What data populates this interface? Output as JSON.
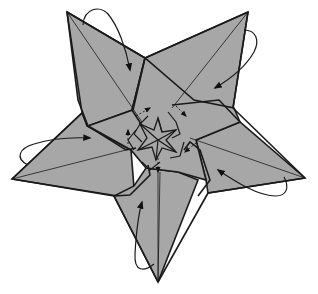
{
  "diagram": {
    "colors": {
      "paper": "#a7a7a7",
      "line": "#1a1a1a",
      "background": "#ffffff"
    },
    "points": [
      {
        "name": "top-left-point",
        "folds": 1
      },
      {
        "name": "top-right-point",
        "folds": 1
      },
      {
        "name": "right-point",
        "folds": 1
      },
      {
        "name": "bottom-point",
        "folds": 1
      },
      {
        "name": "left-point",
        "folds": 1
      }
    ],
    "arrows": [
      {
        "name": "fold-arrow-top-left",
        "type": "valley-fold",
        "direction": "clockwise"
      },
      {
        "name": "fold-arrow-top-right",
        "type": "valley-fold",
        "direction": "clockwise"
      },
      {
        "name": "fold-arrow-right",
        "type": "valley-fold",
        "direction": "clockwise"
      },
      {
        "name": "fold-arrow-bottom",
        "type": "valley-fold",
        "direction": "clockwise"
      },
      {
        "name": "fold-arrow-left",
        "type": "valley-fold",
        "direction": "clockwise"
      }
    ],
    "inner_arrows": 5,
    "center_motif": "five-pointed pinwheel star"
  }
}
